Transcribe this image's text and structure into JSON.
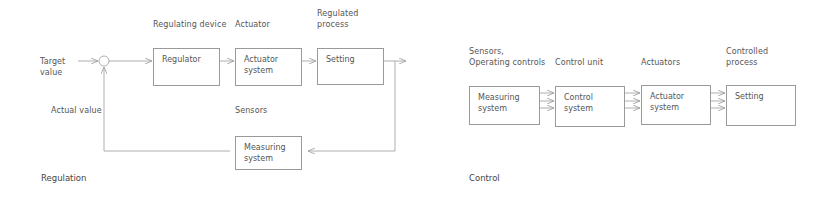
{
  "regulation": {
    "caption": "Regulation",
    "headers": {
      "regulating_device": "Regulating device",
      "actuator": "Actuator",
      "regulated_process": "Regulated\nprocess",
      "sensors": "Sensors"
    },
    "inputs": {
      "target_value": "Target\nvalue",
      "actual_value": "Actual value"
    },
    "boxes": {
      "regulator": "Regulator",
      "actuator_system": "Actuator\nsystem",
      "setting": "Setting",
      "measuring_system": "Measuring\nsystem"
    }
  },
  "control": {
    "caption": "Control",
    "headers": {
      "sensors": "Sensors,\nOperating controls",
      "control_unit": "Control unit",
      "actuators": "Actuators",
      "controlled_process": "Controlled\nprocess"
    },
    "boxes": {
      "measuring_system": "Measuring\nsystem",
      "control_system": "Control\nsystem",
      "actuator_system": "Actuator\nsystem",
      "setting": "Setting"
    }
  },
  "colors": {
    "line": "#9a9a9a",
    "text": "#555555",
    "background": "#ffffff"
  }
}
